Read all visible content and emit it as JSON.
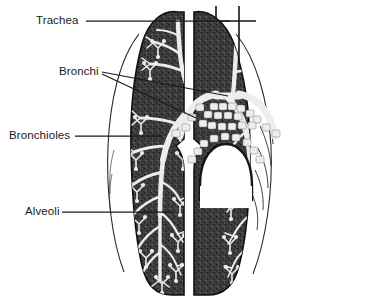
{
  "figure": {
    "background_color": "#ffffff",
    "width": 369,
    "height": 305
  },
  "palette": {
    "lung_tissue": "#3b3b3b",
    "lung_tissue_dark": "#2b2b2b",
    "airway": "#f2f2f2",
    "outline": "#111111",
    "leader_line": "#1a1a1a",
    "label_text": "#1a1a1a",
    "pleura_line": "#2a2a2a"
  },
  "labels": [
    {
      "id": "trachea",
      "text": "Trachea",
      "leader": {
        "from_x": 86,
        "from_y": 21,
        "to_x": 230,
        "to_y": 21
      }
    },
    {
      "id": "bronchi",
      "text": "Bronchi",
      "leader": {
        "from_x": 102,
        "from_y": 72,
        "to_x": 228,
        "to_y": 96
      }
    },
    {
      "id": "bronchioles",
      "text": "Bronchioles",
      "leader": {
        "from_x": 75,
        "from_y": 136,
        "to_x": 160,
        "to_y": 136
      }
    },
    {
      "id": "alveoli",
      "text": "Alveoli",
      "leader": {
        "from_x": 62,
        "from_y": 212,
        "to_x": 172,
        "to_y": 212
      }
    }
  ],
  "structures": {
    "trachea_label": "trachea-tube",
    "left_lung_label": "left-lung",
    "right_lung_label": "right-lung",
    "carina_label": "carina-bifurcation",
    "ribs_label": "rib-outline"
  }
}
